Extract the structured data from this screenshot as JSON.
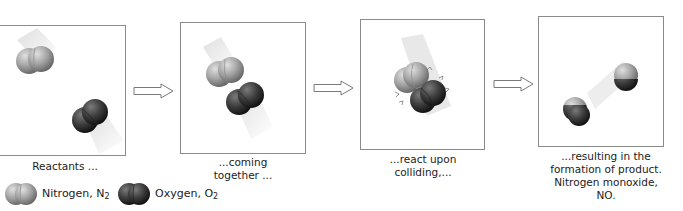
{
  "diagram": {
    "panels": [
      {
        "id": "reactants",
        "caption_lines": [
          "Reactants ..."
        ]
      },
      {
        "id": "coming-together",
        "caption_lines": [
          "...coming",
          "together ..."
        ]
      },
      {
        "id": "react-upon-colliding",
        "caption_lines": [
          "...react upon",
          "colliding,..."
        ]
      },
      {
        "id": "product",
        "caption_lines": [
          "...resulting in the",
          "formation of product.",
          "Nitrogen monoxide, NO."
        ]
      }
    ],
    "arrows": [
      "right-arrow",
      "right-arrow",
      "right-arrow"
    ],
    "legend": [
      {
        "label": "Nitrogen, N",
        "subscript": "2",
        "shade": "light-gray"
      },
      {
        "label": "Oxygen, O",
        "subscript": "2",
        "shade": "dark-gray"
      }
    ]
  },
  "colors": {
    "nitrogen_light": "#c9c9c9",
    "nitrogen_mid": "#9a9a9a",
    "nitrogen_dark": "#6e6e6e",
    "oxygen_light": "#6a6a6a",
    "oxygen_mid": "#3a3a3a",
    "oxygen_dark": "#1e1e1e",
    "panel_border": "#8a8a8a"
  }
}
